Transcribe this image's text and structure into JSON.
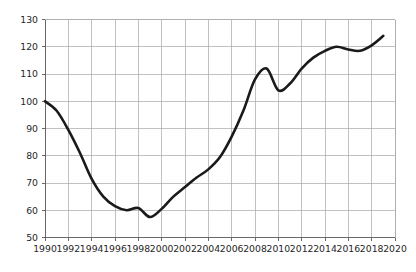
{
  "chart_data": {
    "type": "line",
    "title": "",
    "subtitle": "",
    "xlabel": "",
    "ylabel": "",
    "xlim": [
      1990,
      2020
    ],
    "ylim": [
      50,
      130
    ],
    "grid": true,
    "legend": null,
    "legend_position": "none",
    "line_color": "#1a1a1a",
    "grid_color": "#a6a6a6",
    "axis_color": "#595959",
    "background_color": "#ffffff",
    "x_ticks": [
      1990,
      1992,
      1994,
      1996,
      1998,
      2000,
      2002,
      2004,
      2006,
      2008,
      2010,
      2012,
      2014,
      2016,
      2018,
      2020
    ],
    "x_tick_labels": [
      "1990",
      "1992",
      "1994",
      "1996",
      "1998",
      "2000",
      "2002",
      "2004",
      "2006",
      "2008",
      "2010",
      "2012",
      "2014",
      "2016",
      "2018",
      "2020"
    ],
    "y_ticks": [
      50,
      60,
      70,
      80,
      90,
      100,
      110,
      120,
      130
    ],
    "y_tick_labels": [
      "50",
      "60",
      "70",
      "80",
      "90",
      "100",
      "110",
      "120",
      "130"
    ],
    "series": [
      {
        "name": "Index",
        "x": [
          1990,
          1991,
          1992,
          1993,
          1994,
          1995,
          1996,
          1997,
          1998,
          1999,
          2000,
          2001,
          2002,
          2003,
          2004,
          2005,
          2006,
          2007,
          2008,
          2009,
          2010,
          2011,
          2012,
          2013,
          2014,
          2015,
          2016,
          2017,
          2018,
          2019
        ],
        "values": [
          100.0,
          96.5,
          89.5,
          81.0,
          71.5,
          65.0,
          61.5,
          60.0,
          60.8,
          57.5,
          60.5,
          65.0,
          68.5,
          72.0,
          75.0,
          79.5,
          87.0,
          96.5,
          108.0,
          112.0,
          104.0,
          106.5,
          112.0,
          116.0,
          118.5,
          120.0,
          119.0,
          118.5,
          120.5,
          124.0
        ]
      }
    ]
  },
  "axes": {
    "y_axis_name": "value-axis",
    "x_axis_name": "year-axis"
  }
}
